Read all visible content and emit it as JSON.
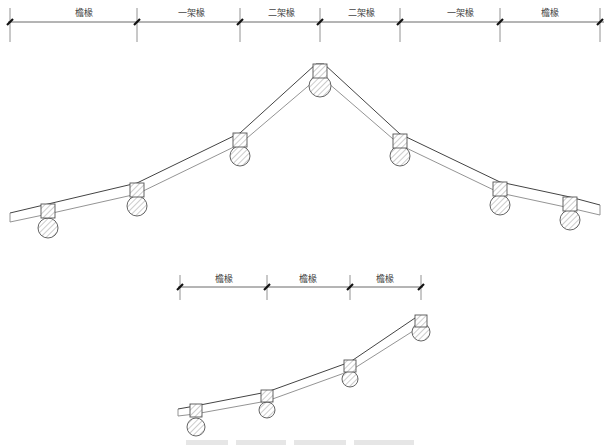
{
  "diagram": {
    "type": "roof-rafter-section",
    "top_section": {
      "dimension_labels": [
        "檐椽",
        "一架椽",
        "二架椽",
        "二架椽",
        "一架椽",
        "檐椽"
      ],
      "dimension_ticks_x": [
        10,
        137,
        240,
        320,
        400,
        500,
        600
      ],
      "purlin_count": 7
    },
    "bottom_section": {
      "dimension_labels": [
        "檐椽",
        "檐椽",
        "檐椽"
      ],
      "dimension_ticks_x": [
        180,
        267,
        350,
        421
      ],
      "purlin_count": 4
    },
    "caption": ""
  }
}
